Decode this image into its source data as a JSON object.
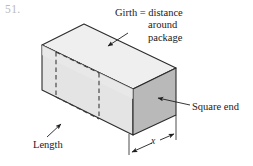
{
  "figure": {
    "problem_number": "51.",
    "labels": {
      "girth_line1": "Girth = distance",
      "girth_line2": "around",
      "girth_line3": "package",
      "square_end": "Square end",
      "length": "Length",
      "dimension_x": "x"
    },
    "colors": {
      "front_face": "#e4e4e4",
      "top_face": "#efefef",
      "right_face": "#b9b9b9",
      "outline": "#2b2b2b",
      "dashed_line": "#3a3a3a",
      "leader_line": "#1f1f1f",
      "text": "#1a1a1a",
      "problem_number": "#b9b9b9",
      "background": "#ffffff"
    },
    "shape": {
      "kind": "rectangular-box-isometric",
      "description": "Rectangular package drawn in oblique projection with a dashed band indicating girth around the package"
    }
  }
}
